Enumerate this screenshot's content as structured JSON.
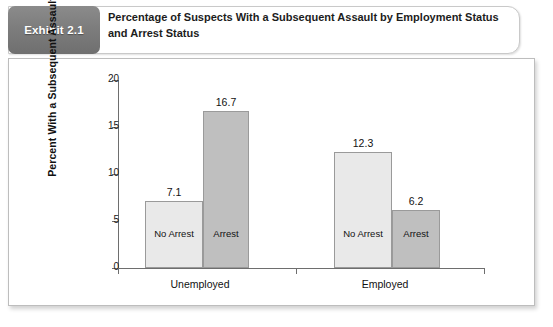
{
  "exhibit": {
    "tag_label": "Exhibit 2.1",
    "title": "Percentage of Suspects With a Subsequent Assault by Employment Status and Arrest Status"
  },
  "colors": {
    "tag_background": "#7d7d7d",
    "tag_text": "#ffffff",
    "bar_light": "#e9e9e9",
    "bar_dark": "#bfbfbf",
    "axis": "#6e6e6e",
    "panel_border": "#bdbdbd"
  },
  "chart_data": {
    "type": "bar",
    "title": "Percentage of Suspects With a Subsequent Assault by Employment Status and Arrest Status",
    "xlabel": "",
    "ylabel": "Percent With a Subsequent Assault",
    "ylim": [
      0,
      20
    ],
    "yticks": [
      0,
      5,
      10,
      15,
      20
    ],
    "ytick_labels": [
      "0",
      "5",
      "10",
      "15",
      "20"
    ],
    "grid": false,
    "legend": "none",
    "categories": [
      "Unemployed",
      "Employed"
    ],
    "series": [
      {
        "name": "No Arrest",
        "values": [
          7.1,
          6.2
        ],
        "color": "#e9e9e9"
      },
      {
        "name": "Arrest",
        "values": [
          16.7,
          12.3
        ],
        "color": "#bfbfbf"
      }
    ],
    "bars": [
      {
        "group": "Unemployed",
        "condition": "No Arrest",
        "value": 7.1,
        "value_label": "7.1",
        "style": "light"
      },
      {
        "group": "Unemployed",
        "condition": "Arrest",
        "value": 16.7,
        "value_label": "16.7",
        "style": "dark"
      },
      {
        "group": "Employed",
        "condition": "No Arrest",
        "value": 12.3,
        "value_label": "12.3",
        "style": "light"
      },
      {
        "group": "Employed",
        "condition": "Arrest",
        "value": 6.2,
        "value_label": "6.2",
        "style": "dark"
      }
    ]
  }
}
